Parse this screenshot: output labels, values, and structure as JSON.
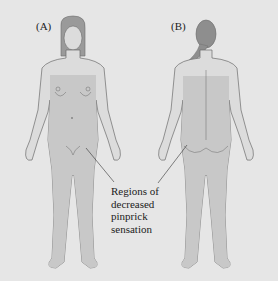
{
  "figure": {
    "panels": [
      {
        "id": "A",
        "label": "(A)",
        "view": "anterior (front)"
      },
      {
        "id": "B",
        "label": "(B)",
        "view": "posterior (back)"
      }
    ],
    "callout": {
      "lines": [
        "Regions of",
        "decreased",
        "pinprick",
        "sensation"
      ]
    },
    "colors": {
      "background": "#e6e6e6",
      "skin": "#dcdcdc",
      "affected_region": "#c8c8c8",
      "hair": "#8e8e8e",
      "outline": "#6b6b6b"
    }
  }
}
